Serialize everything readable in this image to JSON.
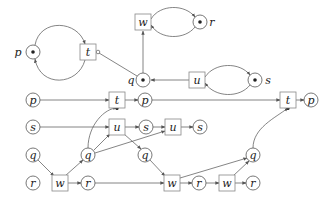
{
  "diagram": {
    "type": "petri-net-with-unfolding",
    "colors": {
      "stroke": "#555555",
      "text": "#222222",
      "background": "#ffffff"
    },
    "net": {
      "places": [
        {
          "id": "P",
          "label": "p",
          "x": 33,
          "y": 52,
          "token": true,
          "label_x": 18,
          "label_y": 52
        },
        {
          "id": "Q",
          "label": "q",
          "x": 143,
          "y": 80,
          "token": true,
          "label_x": 131,
          "label_y": 80
        },
        {
          "id": "R",
          "label": "r",
          "x": 200,
          "y": 22,
          "token": true,
          "label_x": 212,
          "label_y": 22
        },
        {
          "id": "S",
          "label": "s",
          "x": 255,
          "y": 80,
          "token": true,
          "label_x": 268,
          "label_y": 80
        }
      ],
      "transitions": [
        {
          "id": "T",
          "label": "t",
          "x": 88,
          "y": 52
        },
        {
          "id": "W",
          "label": "w",
          "x": 143,
          "y": 22
        },
        {
          "id": "U",
          "label": "u",
          "x": 197,
          "y": 80
        }
      ]
    },
    "unfolding": {
      "places": [
        {
          "label": "p",
          "x": 33,
          "y": 100
        },
        {
          "label": "p",
          "x": 145,
          "y": 100
        },
        {
          "label": "p",
          "x": 311,
          "y": 100
        },
        {
          "label": "s",
          "x": 33,
          "y": 127
        },
        {
          "label": "s",
          "x": 146,
          "y": 127
        },
        {
          "label": "s",
          "x": 200,
          "y": 127
        },
        {
          "label": "q",
          "x": 33,
          "y": 155
        },
        {
          "label": "q",
          "x": 88,
          "y": 155
        },
        {
          "label": "q",
          "x": 145,
          "y": 155
        },
        {
          "label": "q",
          "x": 253,
          "y": 155
        },
        {
          "label": "r",
          "x": 33,
          "y": 183
        },
        {
          "label": "r",
          "x": 88,
          "y": 183
        },
        {
          "label": "r",
          "x": 199,
          "y": 183
        },
        {
          "label": "r",
          "x": 253,
          "y": 183
        }
      ],
      "transitions": [
        {
          "label": "t",
          "x": 117,
          "y": 100
        },
        {
          "label": "t",
          "x": 288,
          "y": 100
        },
        {
          "label": "u",
          "x": 117,
          "y": 127
        },
        {
          "label": "u",
          "x": 173,
          "y": 127
        },
        {
          "label": "w",
          "x": 60,
          "y": 183
        },
        {
          "label": "w",
          "x": 172,
          "y": 183
        },
        {
          "label": "w",
          "x": 227,
          "y": 183
        }
      ]
    }
  }
}
